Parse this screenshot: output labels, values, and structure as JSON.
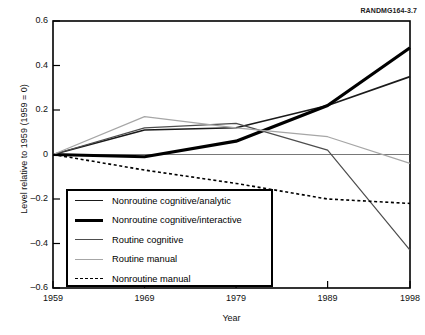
{
  "figure": {
    "tag": "RANDMG164-3.7"
  },
  "chart_data": {
    "type": "line",
    "title": "",
    "xlabel": "Year",
    "ylabel": "Level relative to 1959 (1959 = 0)",
    "x": [
      1959,
      1969,
      1979,
      1989,
      1998
    ],
    "xticklabels": [
      "1959",
      "1969",
      "1979",
      "1989",
      "1998"
    ],
    "yticks": [
      0.6,
      0.4,
      0.2,
      0,
      -0.2,
      -0.4,
      -0.6
    ],
    "yticklabels": [
      "0.6",
      "0.4",
      "0.2",
      "0",
      "–0.2",
      "–0.4",
      "–0.6"
    ],
    "xlim": [
      1959,
      1998
    ],
    "ylim": [
      -0.6,
      0.6
    ],
    "grid": false,
    "legend_position": "lower-left-inside",
    "series": [
      {
        "name": "Nonroutine cognitive/analytic",
        "values": [
          0,
          0.11,
          0.12,
          0.22,
          0.35
        ],
        "color": "#1a1a1a",
        "width": 1.6,
        "dash": "none"
      },
      {
        "name": "Nonroutine cognitive/interactive",
        "values": [
          0,
          -0.01,
          0.06,
          0.22,
          0.48
        ],
        "color": "#000000",
        "width": 3.2,
        "dash": "none"
      },
      {
        "name": "Routine cognitive",
        "values": [
          0,
          0.12,
          0.14,
          0.02,
          -0.43
        ],
        "color": "#4d4d4d",
        "width": 1.2,
        "dash": "none"
      },
      {
        "name": "Routine manual",
        "values": [
          0,
          0.17,
          0.12,
          0.08,
          -0.04
        ],
        "color": "#a6a6a6",
        "width": 1.2,
        "dash": "none"
      },
      {
        "name": "Nonroutine manual",
        "values": [
          0,
          -0.07,
          -0.13,
          -0.2,
          -0.22
        ],
        "color": "#000000",
        "width": 1.6,
        "dash": "3,2.6"
      }
    ]
  }
}
